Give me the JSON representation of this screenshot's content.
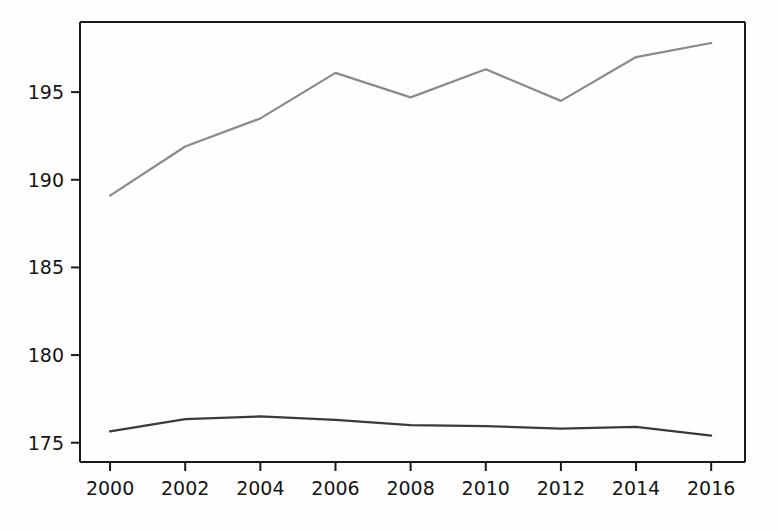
{
  "chart_data": {
    "type": "line",
    "title": "",
    "subtitle": "",
    "xlabel": "",
    "ylabel": "",
    "x": [
      2000,
      2002,
      2004,
      2006,
      2008,
      2010,
      2012,
      2014,
      2016
    ],
    "xtick_labels": [
      "2000",
      "2002",
      "2004",
      "2006",
      "2008",
      "2010",
      "2012",
      "2014",
      "2016"
    ],
    "ytick_labels": [
      "175",
      "180",
      "185",
      "190",
      "195"
    ],
    "yticks": [
      175,
      180,
      185,
      190,
      195
    ],
    "xlim": [
      1999.2,
      2016.9
    ],
    "ylim": [
      173.9,
      199.0
    ],
    "grid": false,
    "legend": "none",
    "series": [
      {
        "name": "upper-series",
        "color": "#8a8a8a",
        "values": [
          189.1,
          191.9,
          193.5,
          196.1,
          194.7,
          196.3,
          194.5,
          197.0,
          197.8
        ]
      },
      {
        "name": "lower-series",
        "color": "#3a3a3a",
        "values": [
          175.65,
          176.35,
          176.5,
          176.3,
          176.0,
          175.95,
          175.8,
          175.9,
          175.4
        ]
      }
    ],
    "axis_color": "#1a1a1a",
    "background_color": "#fefefe",
    "annotations": []
  },
  "axes": {
    "frame_visible": true,
    "tick_direction": "out"
  }
}
